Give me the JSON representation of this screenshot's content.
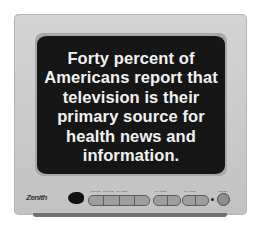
{
  "image": {
    "subject": "Zenith television set",
    "screen": {
      "lines": [
        "Forty percent of",
        "Americans report that",
        "television is their",
        "primary source for",
        "health news and",
        "information."
      ]
    },
    "brand_logo": "Zenith",
    "controls": {
      "button_groups": [
        {
          "label": "VOLUME · PICTURE · CHANNEL",
          "buttons": 4
        },
        {
          "label": "CHANNEL",
          "buttons": 2
        },
        {
          "label": "CHANNEL",
          "buttons": 2
        }
      ],
      "power_knob": "POWER"
    },
    "colors": {
      "cabinet": "#cccccc",
      "screen": "#161616",
      "text": "#f2f2f2"
    }
  }
}
